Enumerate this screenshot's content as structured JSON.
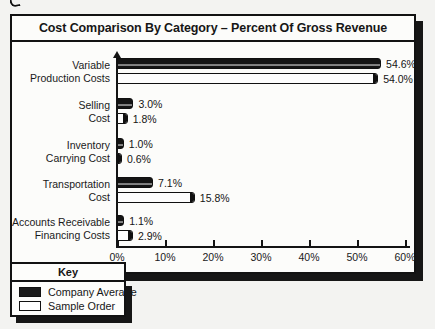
{
  "chart_data": {
    "type": "bar",
    "orientation": "horizontal",
    "title": "Cost Comparison By Category – Percent Of Gross Revenue",
    "categories": [
      [
        "Variable",
        "Production Costs"
      ],
      [
        "Selling",
        "Cost"
      ],
      [
        "Inventory",
        "Carrying Cost"
      ],
      [
        "Transportation",
        "Cost"
      ],
      [
        "Accounts Receivable",
        "Financing Costs"
      ]
    ],
    "series": [
      {
        "name": "Company Average",
        "color": "#1b1b1b",
        "values": [
          54.6,
          3.0,
          1.0,
          7.1,
          1.1
        ],
        "labels": [
          "54.6%",
          "3.0%",
          "1.0%",
          "7.1%",
          "1.1%"
        ]
      },
      {
        "name": "Sample Order",
        "color": "#ffffff",
        "values": [
          54.0,
          1.8,
          0.6,
          15.8,
          2.9
        ],
        "labels": [
          "54.0%",
          "1.8%",
          "0.6%",
          "15.8%",
          "2.9%"
        ]
      }
    ],
    "xlim": [
      0,
      60
    ],
    "xticks": [
      0,
      10,
      20,
      30,
      40,
      50,
      60
    ],
    "xtick_labels": [
      "0%",
      "10%",
      "20%",
      "30%",
      "40%",
      "50%",
      "60%"
    ],
    "grid": false,
    "legend": {
      "header": "Key",
      "position": "bottom-left"
    }
  }
}
